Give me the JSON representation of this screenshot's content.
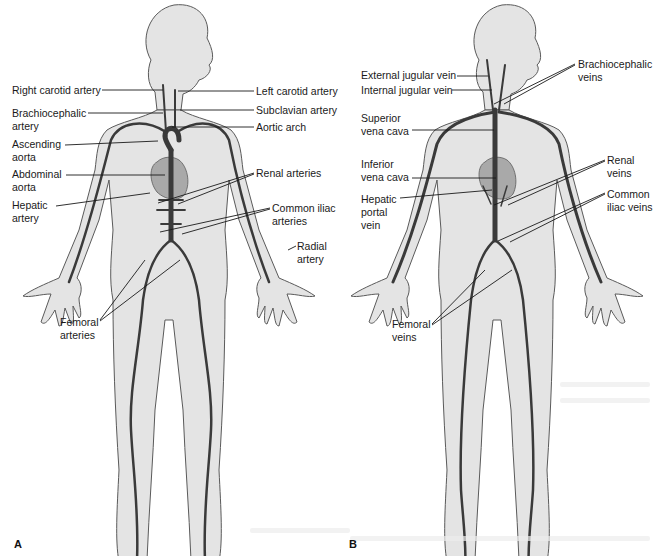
{
  "figure": {
    "panel_a": {
      "letter": "A",
      "labels": [
        {
          "id": "right-carotid-artery",
          "text": "Right carotid artery",
          "x": 12,
          "y": 84
        },
        {
          "id": "left-carotid-artery",
          "text": "Left carotid artery",
          "x": 256,
          "y": 86
        },
        {
          "id": "brachiocephalic-artery",
          "text": "Brachiocephalic\nartery",
          "x": 12,
          "y": 108
        },
        {
          "id": "subclavian-artery",
          "text": "Subclavian artery",
          "x": 256,
          "y": 105
        },
        {
          "id": "aortic-arch",
          "text": "Aortic arch",
          "x": 256,
          "y": 121
        },
        {
          "id": "ascending-aorta",
          "text": "Ascending\naorta",
          "x": 12,
          "y": 138
        },
        {
          "id": "abdominal-aorta",
          "text": "Abdominal\naorta",
          "x": 12,
          "y": 168
        },
        {
          "id": "renal-arteries",
          "text": "Renal arteries",
          "x": 256,
          "y": 168
        },
        {
          "id": "hepatic-artery",
          "text": "Hepatic\nartery",
          "x": 12,
          "y": 198
        },
        {
          "id": "common-iliac-arteries",
          "text": "Common iliac\narteries",
          "x": 272,
          "y": 203
        },
        {
          "id": "radial-artery",
          "text": "Radial\nartery",
          "x": 297,
          "y": 241
        },
        {
          "id": "femoral-arteries",
          "text": "Femoral\narteries",
          "x": 60,
          "y": 316
        }
      ]
    },
    "panel_b": {
      "letter": "B",
      "labels": [
        {
          "id": "external-jugular-vein",
          "text": "External jugular vein",
          "x": 361,
          "y": 70
        },
        {
          "id": "internal-jugular-vein",
          "text": "Internal jugular vein",
          "x": 361,
          "y": 85
        },
        {
          "id": "brachiocephalic-veins",
          "text": "Brachiocephalic\nveins",
          "x": 578,
          "y": 58
        },
        {
          "id": "superior-vena-cava",
          "text": "Superior\nvena cava",
          "x": 361,
          "y": 112
        },
        {
          "id": "inferior-vena-cava",
          "text": "Inferior\nvena cava",
          "x": 361,
          "y": 158
        },
        {
          "id": "renal-veins",
          "text": "Renal\nveins",
          "x": 607,
          "y": 154
        },
        {
          "id": "hepatic-portal-vein",
          "text": "Hepatic\nportal\nvein",
          "x": 361,
          "y": 195
        },
        {
          "id": "common-iliac-veins",
          "text": "Common\niliac veins",
          "x": 607,
          "y": 188
        },
        {
          "id": "femoral-veins",
          "text": "Femoral\nveins",
          "x": 392,
          "y": 318
        }
      ]
    },
    "colors": {
      "body_fill": "#e4e4e4",
      "body_outline": "#5a5a5a",
      "vessel": "#3a3a3a",
      "heart": "#a9a9a9",
      "leader_line": "#1a1a1a",
      "text": "#1a1a1a"
    }
  }
}
